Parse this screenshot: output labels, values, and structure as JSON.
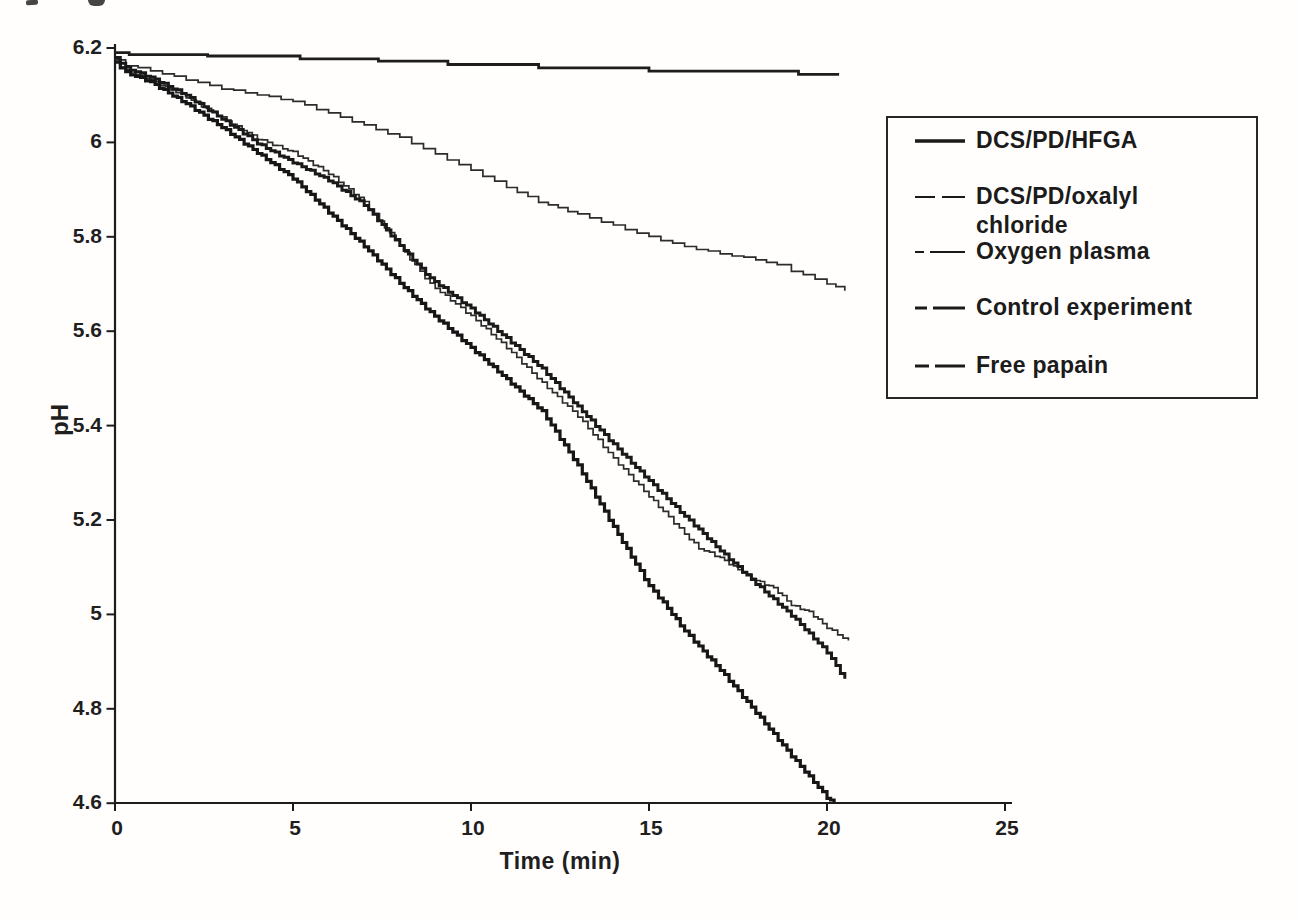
{
  "figure": {
    "background": "#fffefd",
    "ink": "#1c1c1c"
  },
  "chart_data": {
    "type": "line",
    "title": "",
    "xlabel": "Time (min)",
    "ylabel": "pH",
    "xlim": [
      0,
      25
    ],
    "ylim": [
      4.6,
      6.2
    ],
    "grid": false,
    "legend_position": "right-overlay",
    "x_ticks": [
      0,
      5,
      10,
      15,
      20,
      25
    ],
    "x_tick_labels": [
      "0",
      "5",
      "10",
      "15",
      "20",
      "25"
    ],
    "y_ticks": [
      6.2,
      6.0,
      5.8,
      5.6,
      5.4,
      5.2,
      5.0,
      4.8,
      4.6
    ],
    "y_tick_labels": [
      "6.2",
      "6",
      "5.8",
      "5.6",
      "5.4",
      "5.2",
      "5",
      "4.8",
      "4.6"
    ],
    "series": [
      {
        "name": "DCS/PD/HFGA",
        "slug": "dcs-pd-hfga",
        "color": "#1d1d1d",
        "stroke_width": 2.8,
        "style": "coarse-steps",
        "step_min": 0,
        "jitter": 0,
        "points": [
          [
            0,
            6.19
          ],
          [
            0.4,
            6.186
          ],
          [
            2.6,
            6.183
          ],
          [
            5.2,
            6.177
          ],
          [
            7.4,
            6.172
          ],
          [
            9.35,
            6.165
          ],
          [
            11.9,
            6.158
          ],
          [
            15.0,
            6.151
          ],
          [
            19.2,
            6.144
          ],
          [
            20.3,
            6.141
          ]
        ]
      },
      {
        "name": "DCS/PD/oxalyl chloride",
        "slug": "dcs-pd-oxalyl-chloride",
        "color": "#2c2c2c",
        "stroke_width": 1.7,
        "style": "fine-steps",
        "step_min": 0.3,
        "jitter": 0.5,
        "points": [
          [
            0,
            6.175
          ],
          [
            0.3,
            6.163
          ],
          [
            1,
            6.152
          ],
          [
            2,
            6.133
          ],
          [
            3,
            6.114
          ],
          [
            4,
            6.101
          ],
          [
            5,
            6.087
          ],
          [
            6,
            6.062
          ],
          [
            7,
            6.036
          ],
          [
            8,
            6.01
          ],
          [
            9,
            5.975
          ],
          [
            10,
            5.941
          ],
          [
            11,
            5.905
          ],
          [
            11.9,
            5.874
          ],
          [
            13,
            5.848
          ],
          [
            14,
            5.824
          ],
          [
            15,
            5.8
          ],
          [
            16,
            5.779
          ],
          [
            17,
            5.764
          ],
          [
            18,
            5.752
          ],
          [
            18.6,
            5.74
          ],
          [
            19,
            5.728
          ],
          [
            20,
            5.701
          ],
          [
            20.5,
            5.686
          ]
        ]
      },
      {
        "name": "Oxygen plasma",
        "slug": "oxygen-plasma",
        "color": "#2c2c2c",
        "stroke_width": 1.7,
        "style": "fine-steps",
        "step_min": 0.14,
        "jitter": 1.0,
        "points": [
          [
            0,
            6.17
          ],
          [
            0.3,
            6.152
          ],
          [
            1,
            6.133
          ],
          [
            2,
            6.096
          ],
          [
            3,
            6.052
          ],
          [
            4,
            6.008
          ],
          [
            5,
            5.979
          ],
          [
            6,
            5.934
          ],
          [
            7,
            5.874
          ],
          [
            8,
            5.78
          ],
          [
            8.85,
            5.7
          ],
          [
            10,
            5.632
          ],
          [
            11,
            5.565
          ],
          [
            12,
            5.49
          ],
          [
            13,
            5.42
          ],
          [
            14,
            5.33
          ],
          [
            15,
            5.25
          ],
          [
            15.4,
            5.218
          ],
          [
            16,
            5.17
          ],
          [
            16.4,
            5.14
          ],
          [
            17,
            5.12
          ],
          [
            17.5,
            5.095
          ],
          [
            18,
            5.072
          ],
          [
            18.5,
            5.056
          ],
          [
            19,
            5.02
          ],
          [
            19.5,
            5.005
          ],
          [
            20,
            4.972
          ],
          [
            20.6,
            4.943
          ]
        ]
      },
      {
        "name": "Control experiment",
        "slug": "control-experiment",
        "color": "#191919",
        "stroke_width": 3.0,
        "style": "fine-steps",
        "step_min": 0.13,
        "jitter": 0.9,
        "points": [
          [
            0,
            6.18
          ],
          [
            0.3,
            6.158
          ],
          [
            1,
            6.138
          ],
          [
            2,
            6.1
          ],
          [
            3,
            6.05
          ],
          [
            3.6,
            6.02
          ],
          [
            4,
            5.998
          ],
          [
            5,
            5.958
          ],
          [
            6,
            5.92
          ],
          [
            7,
            5.868
          ],
          [
            8,
            5.782
          ],
          [
            8.85,
            5.712
          ],
          [
            10,
            5.648
          ],
          [
            11,
            5.585
          ],
          [
            12,
            5.52
          ],
          [
            13,
            5.44
          ],
          [
            14,
            5.36
          ],
          [
            15,
            5.283
          ],
          [
            16,
            5.208
          ],
          [
            16.4,
            5.18
          ],
          [
            17,
            5.135
          ],
          [
            17.5,
            5.1
          ],
          [
            18,
            5.065
          ],
          [
            19,
            4.998
          ],
          [
            20,
            4.92
          ],
          [
            20.5,
            4.862
          ]
        ]
      },
      {
        "name": "Free papain",
        "slug": "free-papain",
        "color": "#161616",
        "stroke_width": 3.2,
        "style": "fine-steps",
        "step_min": 0.13,
        "jitter": 0.9,
        "points": [
          [
            0,
            6.17
          ],
          [
            0.3,
            6.148
          ],
          [
            1,
            6.128
          ],
          [
            2,
            6.082
          ],
          [
            3,
            6.032
          ],
          [
            4,
            5.978
          ],
          [
            5,
            5.924
          ],
          [
            6,
            5.852
          ],
          [
            7,
            5.78
          ],
          [
            8,
            5.702
          ],
          [
            8.85,
            5.64
          ],
          [
            10,
            5.565
          ],
          [
            11,
            5.498
          ],
          [
            12,
            5.43
          ],
          [
            13,
            5.315
          ],
          [
            14,
            5.185
          ],
          [
            15,
            5.06
          ],
          [
            15.4,
            5.025
          ],
          [
            16,
            4.965
          ],
          [
            16.4,
            4.932
          ],
          [
            17,
            4.882
          ],
          [
            18,
            4.792
          ],
          [
            19,
            4.7
          ],
          [
            20,
            4.612
          ],
          [
            20.2,
            4.6
          ]
        ]
      }
    ]
  },
  "legend": {
    "border_color": "#272727",
    "items": [
      {
        "series": "DCS/PD/HFGA",
        "lines": [
          "DCS/PD/HFGA"
        ],
        "dash": "",
        "width": 3.4
      },
      {
        "series": "DCS/PD/oxalyl chloride",
        "lines": [
          "DCS/PD/oxalyl",
          "chloride"
        ],
        "dash": "20 7 30",
        "width": 2
      },
      {
        "series": "Oxygen plasma",
        "lines": [
          "Oxygen plasma"
        ],
        "dash": "9 6 40",
        "width": 2
      },
      {
        "series": "Control experiment",
        "lines": [
          "Control experiment"
        ],
        "dash": "12 6 40",
        "width": 3.2
      },
      {
        "series": "Free papain",
        "lines": [
          "Free papain"
        ],
        "dash": "14 6 40",
        "width": 3.2
      }
    ]
  }
}
